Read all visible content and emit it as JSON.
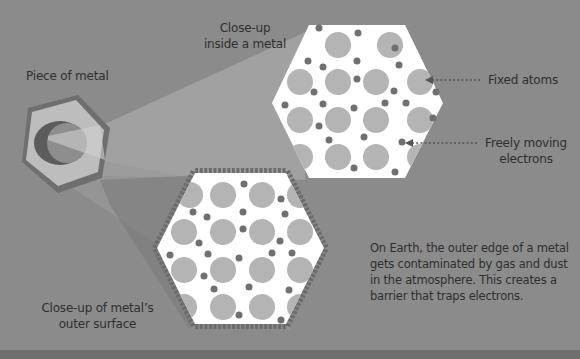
{
  "labels": {
    "piece_of_metal": "Piece of metal",
    "closeup_inside_line1": "Close-up",
    "closeup_inside_line2": "inside a metal",
    "fixed_atoms": "Fixed atoms",
    "free_electrons_line1": "Freely moving",
    "free_electrons_line2": "electrons",
    "closeup_surface_line1": "Close-up of metal’s",
    "closeup_surface_line2": "outer surface"
  },
  "caption": {
    "line1": "On Earth, the outer edge of a metal",
    "line2": "gets contaminated by gas and dust",
    "line3": "in the atmosphere. This creates a",
    "line4": "barrier that traps electrons."
  },
  "colors": {
    "background": "#8b8b8b",
    "atom": "#b4b4b4",
    "electron": "#707070",
    "hex_fill": "#ffffff",
    "text": "#2f2f2f"
  }
}
